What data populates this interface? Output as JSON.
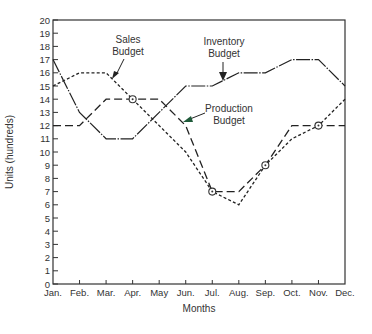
{
  "chart_data": {
    "type": "line",
    "title": "",
    "xlabel": "Months",
    "ylabel": "Units (hundreds)",
    "categories": [
      "Jan.",
      "Feb.",
      "Mar.",
      "Apr.",
      "May",
      "Jun.",
      "Jul.",
      "Aug.",
      "Sep.",
      "Oct.",
      "Nov.",
      "Dec."
    ],
    "yticks": [
      0,
      1,
      2,
      3,
      4,
      5,
      6,
      7,
      8,
      9,
      10,
      11,
      12,
      13,
      14,
      15,
      16,
      17,
      18,
      19,
      20
    ],
    "ylim": [
      0,
      20
    ],
    "grid": false,
    "series": [
      {
        "name": "Inventory Budget",
        "style": "dash-dot-solid",
        "values": [
          17,
          13,
          11,
          11,
          13,
          15,
          15,
          16,
          16,
          17,
          17,
          15
        ]
      },
      {
        "name": "Sales Budget",
        "style": "short-dash",
        "values": [
          15,
          16,
          16,
          14,
          12,
          10,
          7,
          6,
          9,
          11,
          12,
          14
        ]
      },
      {
        "name": "Production Budget",
        "style": "long-dash",
        "values": [
          12,
          12,
          14,
          14,
          14,
          12,
          7,
          7,
          9,
          12,
          12,
          12
        ]
      }
    ],
    "markers": [
      {
        "month": "Apr.",
        "value": 14
      },
      {
        "month": "Jul.",
        "value": 7
      },
      {
        "month": "Sep.",
        "value": 9
      },
      {
        "month": "Nov.",
        "value": 12
      }
    ],
    "annotations": [
      {
        "text_line1": "Sales",
        "text_line2": "Budget",
        "points_to": "Sales Budget"
      },
      {
        "text_line1": "Inventory",
        "text_line2": "Budget",
        "points_to": "Inventory Budget"
      },
      {
        "text_line1": "Production",
        "text_line2": "Budget",
        "points_to": "Production Budget"
      }
    ]
  }
}
